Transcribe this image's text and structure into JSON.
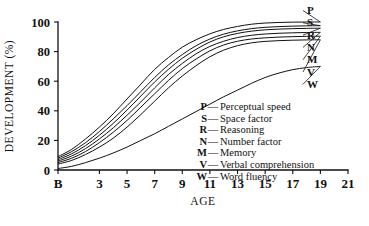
{
  "chart_data": {
    "type": "line",
    "title": "",
    "xlabel": "AGE",
    "ylabel": "DEVELOPMENT (%)",
    "xlim": [
      0,
      21
    ],
    "ylim": [
      0,
      100
    ],
    "grid": false,
    "legend_position": "inside-lower-right",
    "x_tick_labels": [
      "B",
      "3",
      "5",
      "7",
      "9",
      "11",
      "13",
      "15",
      "17",
      "19",
      "21"
    ],
    "x_tick_values": [
      0,
      3,
      5,
      7,
      9,
      11,
      13,
      15,
      17,
      19,
      21
    ],
    "y_tick_labels": [
      "0",
      "20",
      "40",
      "60",
      "80",
      "100"
    ],
    "y_tick_values": [
      0,
      20,
      40,
      60,
      80,
      100
    ],
    "x": [
      0,
      1,
      2,
      3,
      4,
      5,
      6,
      7,
      8,
      9,
      10,
      11,
      12,
      13,
      14,
      15,
      16,
      17,
      18,
      19
    ],
    "series": [
      {
        "name": "P",
        "label": "Perceptual speed",
        "values": [
          9,
          14,
          21,
          29,
          38,
          48,
          58,
          68,
          76,
          83,
          88,
          92,
          95,
          97,
          98.5,
          99.3,
          99.7,
          99.9,
          100,
          100
        ]
      },
      {
        "name": "S",
        "label": "Space factor",
        "values": [
          8,
          12.5,
          18.5,
          26,
          34.5,
          43.5,
          53,
          62.5,
          71,
          78,
          84,
          88.5,
          91.8,
          94,
          95.5,
          96.4,
          96.9,
          97.2,
          97.4,
          97.5
        ]
      },
      {
        "name": "R",
        "label": "Reasoning",
        "values": [
          7,
          11,
          16.5,
          23.5,
          31.5,
          40.5,
          50,
          59.5,
          68,
          75.5,
          81.5,
          86.5,
          90,
          92.3,
          93.8,
          94.7,
          95.2,
          95.5,
          95.7,
          95.8
        ]
      },
      {
        "name": "N",
        "label": "Number factor",
        "values": [
          6,
          9.5,
          14.5,
          21,
          28.5,
          37,
          46,
          55.5,
          64.5,
          72,
          78.5,
          83.5,
          87,
          89.5,
          91,
          91.9,
          92.4,
          92.7,
          92.9,
          93
        ]
      },
      {
        "name": "M",
        "label": "Memory",
        "values": [
          5,
          8,
          12.5,
          18.5,
          25.5,
          33.5,
          42.5,
          51.5,
          60.5,
          68.5,
          75,
          80.5,
          84.5,
          87,
          88.5,
          89.3,
          89.8,
          90.1,
          90.3,
          90.4
        ]
      },
      {
        "name": "V",
        "label": "Verbal comprehension",
        "values": [
          4,
          6.5,
          10.5,
          15.5,
          21.5,
          29,
          37.5,
          46.5,
          55.5,
          63.5,
          70.5,
          76.5,
          81,
          84,
          85.9,
          86.9,
          87.4,
          87.7,
          87.9,
          88
        ]
      },
      {
        "name": "W",
        "label": "Word fluency",
        "values": [
          1,
          2.5,
          5,
          8,
          11.5,
          15.5,
          20,
          24.5,
          29.5,
          34.5,
          39.5,
          44.5,
          49.5,
          54,
          58.5,
          62.5,
          65.5,
          67.8,
          69.2,
          70
        ]
      }
    ]
  },
  "end_labels": [
    {
      "key": "P"
    },
    {
      "key": "S"
    },
    {
      "key": "R"
    },
    {
      "key": "N"
    },
    {
      "key": "M"
    },
    {
      "key": "V"
    },
    {
      "key": "W"
    }
  ],
  "legend": {
    "dash": "—",
    "items": [
      {
        "key": "P",
        "label": "Perceptual speed"
      },
      {
        "key": "S",
        "label": "Space factor"
      },
      {
        "key": "R",
        "label": "Reasoning"
      },
      {
        "key": "N",
        "label": "Number factor"
      },
      {
        "key": "M",
        "label": "Memory"
      },
      {
        "key": "V",
        "label": "Verbal comprehension"
      },
      {
        "key": "W",
        "label": "Word fluency"
      }
    ]
  },
  "colors": {
    "ink": "#111111",
    "background": "#ffffff"
  }
}
